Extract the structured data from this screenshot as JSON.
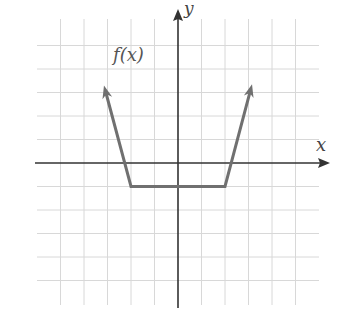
{
  "chart_data": {
    "type": "line",
    "title": "",
    "xlabel": "x",
    "ylabel": "y",
    "function_label": "f(x)",
    "grid": true,
    "tick_labels": false,
    "xlim": [
      -6,
      6
    ],
    "ylim": [
      -5,
      6
    ],
    "series": [
      {
        "name": "f(x)",
        "color": "#707070",
        "points": [
          [
            -3.15,
            3.3
          ],
          [
            -2,
            -1
          ],
          [
            2,
            -1
          ],
          [
            3.15,
            3.35
          ]
        ],
        "left_arrow": true,
        "right_arrow": true
      }
    ],
    "x_intercepts": [
      -1.75,
      1.75
    ],
    "y_intercept": -1,
    "minimum_value": -1
  },
  "labels": {
    "x_axis": "x",
    "y_axis": "y",
    "function": "f(x)"
  },
  "colors": {
    "grid": "#d8d8d8",
    "axis": "#333333",
    "curve": "#707070"
  }
}
